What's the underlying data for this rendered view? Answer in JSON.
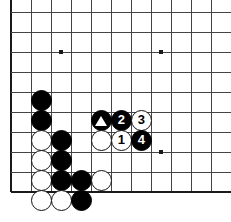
{
  "board": {
    "kind": "go-board-diagram",
    "title": "Go board position diagram",
    "grid": {
      "origin_x": 11,
      "origin_y": 12,
      "spacing": 20,
      "cols": 11,
      "rows": 10,
      "line_color": "#444444",
      "edge_color": "#1a1a1a",
      "background": "#ffffff",
      "cropped_right": true,
      "cropped_top": true
    },
    "star_points": [
      {
        "x": 61,
        "y": 52
      },
      {
        "x": 161,
        "y": 52
      },
      {
        "x": 161,
        "y": 152
      }
    ],
    "stone_radius": 10.5,
    "stones": [
      {
        "name": "black-stone-a",
        "color": "black",
        "x": 41,
        "y": 100,
        "label": ""
      },
      {
        "name": "black-stone-b",
        "color": "black",
        "x": 41,
        "y": 120,
        "label": ""
      },
      {
        "name": "white-stone-a",
        "color": "white",
        "x": 41,
        "y": 140,
        "label": ""
      },
      {
        "name": "black-stone-c",
        "color": "black",
        "x": 61,
        "y": 140,
        "label": ""
      },
      {
        "name": "white-stone-b",
        "color": "white",
        "x": 41,
        "y": 160,
        "label": ""
      },
      {
        "name": "black-stone-d",
        "color": "black",
        "x": 61,
        "y": 160,
        "label": ""
      },
      {
        "name": "white-stone-c",
        "color": "white",
        "x": 41,
        "y": 180,
        "label": ""
      },
      {
        "name": "black-stone-e",
        "color": "black",
        "x": 61,
        "y": 180,
        "label": ""
      },
      {
        "name": "black-stone-f",
        "color": "black",
        "x": 81,
        "y": 180,
        "label": ""
      },
      {
        "name": "white-stone-d",
        "color": "white",
        "x": 101,
        "y": 180,
        "label": ""
      },
      {
        "name": "white-stone-e",
        "color": "white",
        "x": 41,
        "y": 200,
        "label": ""
      },
      {
        "name": "white-stone-f",
        "color": "white",
        "x": 61,
        "y": 200,
        "label": ""
      },
      {
        "name": "black-stone-g",
        "color": "black",
        "x": 81,
        "y": 200,
        "label": ""
      },
      {
        "name": "black-stone-triangle",
        "color": "black",
        "x": 101,
        "y": 120,
        "label": "triangle-marker"
      },
      {
        "name": "black-stone-move-2",
        "color": "black",
        "x": 121,
        "y": 120,
        "label": "2"
      },
      {
        "name": "white-stone-move-3",
        "color": "white",
        "x": 141,
        "y": 120,
        "label": "3"
      },
      {
        "name": "white-stone-h",
        "color": "white",
        "x": 101,
        "y": 140,
        "label": ""
      },
      {
        "name": "white-stone-move-1",
        "color": "white",
        "x": 121,
        "y": 140,
        "label": "1"
      },
      {
        "name": "black-stone-move-4",
        "color": "black",
        "x": 141,
        "y": 140,
        "label": "4"
      }
    ],
    "move_labels": [
      "1",
      "2",
      "3",
      "4"
    ],
    "marker_glyph": "triangle"
  }
}
